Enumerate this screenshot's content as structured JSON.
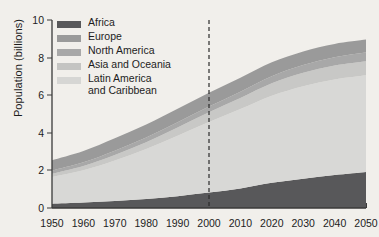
{
  "chart_data": {
    "type": "area",
    "title": "",
    "xlabel": "",
    "ylabel": "Population (billions)",
    "xlim": [
      1950,
      2050
    ],
    "ylim": [
      0,
      10
    ],
    "grid": false,
    "legend_position": "top-left",
    "stacked": true,
    "x": [
      1950,
      1960,
      1970,
      1980,
      1990,
      2000,
      2010,
      2020,
      2030,
      2040,
      2050
    ],
    "xticklabels": [
      "1950",
      "1960",
      "1970",
      "1980",
      "1990",
      "2000",
      "2010",
      "2020",
      "2030",
      "2040",
      "2050"
    ],
    "yticklabels": [
      "0",
      "2",
      "4",
      "6",
      "8",
      "10"
    ],
    "yticks": [
      0,
      2,
      4,
      6,
      8,
      10
    ],
    "annotations": [
      {
        "type": "vertical-dashed-line",
        "x": 2000,
        "label": ""
      }
    ],
    "series": [
      {
        "name": "Africa",
        "color": "#58585a",
        "values": [
          0.23,
          0.29,
          0.37,
          0.48,
          0.63,
          0.82,
          1.04,
          1.34,
          1.56,
          1.76,
          1.92
        ]
      },
      {
        "name": "Asia and Oceania",
        "color": "#d8d8d6",
        "values": [
          1.42,
          1.72,
          2.16,
          2.66,
          3.21,
          3.75,
          4.22,
          4.63,
          4.92,
          5.08,
          5.14
        ]
      },
      {
        "name": "Latin America and Caribbean",
        "color": "#c8c8c6",
        "values": [
          0.17,
          0.22,
          0.29,
          0.36,
          0.44,
          0.52,
          0.59,
          0.66,
          0.71,
          0.74,
          0.75
        ]
      },
      {
        "name": "North America",
        "color": "#a8a8a8",
        "values": [
          0.17,
          0.2,
          0.23,
          0.25,
          0.28,
          0.31,
          0.34,
          0.38,
          0.41,
          0.44,
          0.46
        ]
      },
      {
        "name": "Europe",
        "color": "#9a9a9a",
        "values": [
          0.55,
          0.6,
          0.66,
          0.69,
          0.72,
          0.73,
          0.74,
          0.74,
          0.73,
          0.71,
          0.69
        ]
      }
    ],
    "totals": [
      2.54,
      3.03,
      3.71,
      4.44,
      5.28,
      6.13,
      6.93,
      7.75,
      8.33,
      8.73,
      8.96
    ]
  },
  "legend": {
    "items": [
      {
        "label": "Africa",
        "color": "#58585a"
      },
      {
        "label": "Europe",
        "color": "#9a9a9a"
      },
      {
        "label": "North America",
        "color": "#a8a8a8"
      },
      {
        "label": "Asia and Oceania",
        "color": "#c4c4c2"
      },
      {
        "label": "Latin America\nand Caribbean",
        "color": "#d6d6d4"
      }
    ]
  },
  "axes": {
    "y_title": "Population (billions)",
    "axis_color": "#3a3a3a",
    "background": "#f1efeb"
  }
}
